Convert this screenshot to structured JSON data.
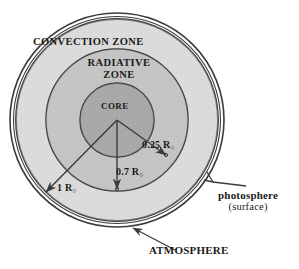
{
  "figure": {
    "center": {
      "x": 117,
      "y": 120
    },
    "colors": {
      "background": "#ffffff",
      "stroke": "#3a3a3a",
      "atmosphere_ring": "#ffffff",
      "convection_fill": "#c9c9c9",
      "radiative_fill": "#b0b0b0",
      "core_fill": "#8f8f8f",
      "text": "#1a1a1a"
    },
    "layers": [
      {
        "name": "atmosphere",
        "label": "ATMOSPHERE",
        "radius_px": 107,
        "fill": "#ffffff"
      },
      {
        "name": "photosphere",
        "label": "photosphere",
        "radius_px": 101,
        "fill": "#c9c9c9"
      },
      {
        "name": "convection-zone",
        "label": "CONVECTION ZONE",
        "radius_px": 101,
        "fill": "#c9c9c9"
      },
      {
        "name": "radiative-zone",
        "label": "RADIATIVE ZONE",
        "radius_px": 71,
        "fill": "#b0b0b0"
      },
      {
        "name": "core",
        "label": "CORE",
        "radius_px": 37,
        "fill": "#8f8f8f"
      }
    ],
    "zone_labels": {
      "convection": "CONVECTION ZONE",
      "radiative_line1": "RADIATIVE",
      "radiative_line2": "ZONE",
      "core": "CORE"
    },
    "radius_markers": [
      {
        "name": "core-radius",
        "value": "0.25 R",
        "unit_subscript": "○",
        "fraction": 0.25
      },
      {
        "name": "radiative-radius",
        "value": "0.7 R",
        "unit_subscript": "○",
        "fraction": 0.7
      },
      {
        "name": "solar-radius",
        "value": "1 R",
        "unit_subscript": "○",
        "fraction": 1.0
      }
    ],
    "callouts": [
      {
        "name": "photosphere",
        "line1": "photosphere",
        "line2": "(surface)"
      },
      {
        "name": "atmosphere",
        "line1": "ATMOSPHERE",
        "line2": ""
      }
    ]
  }
}
